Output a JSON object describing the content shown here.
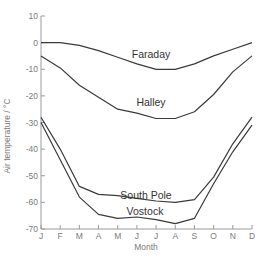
{
  "chart_data": {
    "type": "line",
    "title": "",
    "xlabel": "Month",
    "ylabel": "Air temperature / °C",
    "categories": [
      "J",
      "F",
      "M",
      "A",
      "M",
      "J",
      "J",
      "A",
      "S",
      "O",
      "N",
      "D"
    ],
    "ylim": [
      -70,
      10
    ],
    "yticks": [
      10,
      0,
      -10,
      -20,
      -30,
      -40,
      -50,
      -60,
      -70
    ],
    "grid": false,
    "legend_position": "inline labels",
    "series": [
      {
        "name": "Faraday",
        "values": [
          0,
          0,
          -1,
          -3,
          -5.5,
          -8,
          -10,
          -10,
          -8,
          -5,
          -2.5,
          0
        ]
      },
      {
        "name": "Halley",
        "values": [
          -5,
          -9.5,
          -16,
          -20.5,
          -25,
          -26.5,
          -28.5,
          -28.5,
          -26,
          -19.5,
          -11,
          -5
        ]
      },
      {
        "name": "South Pole",
        "values": [
          -28,
          -40,
          -54,
          -57,
          -57.5,
          -58.5,
          -59.5,
          -60,
          -59,
          -50.5,
          -38,
          -28
        ]
      },
      {
        "name": "Vostock",
        "values": [
          -30,
          -44,
          -58,
          -64.5,
          -66,
          -65.5,
          -66.5,
          -68,
          -66,
          -53,
          -41,
          -31
        ]
      }
    ],
    "annotations": [
      {
        "text": "Faraday",
        "x": "J",
        "y": -6
      },
      {
        "text": "Halley",
        "x": "J",
        "y": -24
      },
      {
        "text": "South Pole",
        "x": "J",
        "y": -54
      },
      {
        "text": "Vostock",
        "x": "J",
        "y": -63
      }
    ],
    "colors": {
      "line": "#3a3a3a",
      "axis": "#9a9a9a",
      "text": "#7a7a7a"
    }
  }
}
